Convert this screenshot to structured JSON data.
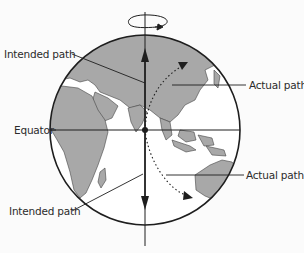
{
  "diagram": {
    "labels": {
      "intended_path_north": "Intended path",
      "actual_path_north": "Actual path",
      "equator": "Equator",
      "intended_path_south": "Intended path",
      "actual_path_south": "Actual path"
    },
    "elements": {
      "globe": "Earth seen from space, centered on Indian Ocean",
      "rotation_arrow": "rotation-arrow-icon (counter-clockwise around axis)",
      "axis": "Earth rotation axis (vertical line)",
      "equator_line": "horizontal line through globe center",
      "intended_arrows": [
        "north (straight up)",
        "south (straight down)"
      ],
      "actual_arrows": [
        "north-east dotted curve",
        "south-east dotted curve"
      ]
    },
    "colors": {
      "land": "#a8a8a8",
      "ocean": "#ffffff",
      "lines": "#1e1e1e",
      "background": "#fbfbfb"
    }
  }
}
